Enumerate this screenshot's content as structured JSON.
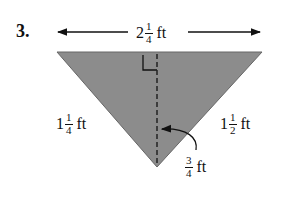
{
  "problem_number": "3.",
  "top": {
    "whole": "2",
    "num": "1",
    "den": "4",
    "unit": "ft"
  },
  "left": {
    "whole": "1",
    "num": "1",
    "den": "4",
    "unit": "ft"
  },
  "right": {
    "whole": "1",
    "num": "1",
    "den": "2",
    "unit": "ft"
  },
  "height": {
    "num": "3",
    "den": "4",
    "unit": "ft"
  },
  "colors": {
    "triangle_fill": "#8c8c8c",
    "ink": "#111111"
  }
}
